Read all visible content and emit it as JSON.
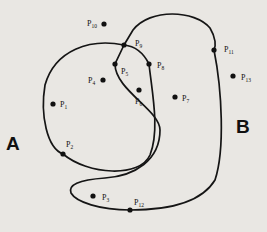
{
  "diagram": {
    "regions": [
      {
        "id": "A",
        "label": "A",
        "x": 6,
        "y": 150
      },
      {
        "id": "B",
        "label": "B",
        "x": 236,
        "y": 133
      }
    ],
    "points": [
      {
        "id": "P1",
        "base": "P",
        "sub": "1",
        "x": 53,
        "y": 104,
        "lx": 60,
        "ly": 107,
        "on_curve": false
      },
      {
        "id": "P2",
        "base": "P",
        "sub": "2",
        "x": 63,
        "y": 154,
        "lx": 66,
        "ly": 147,
        "on_curve": true
      },
      {
        "id": "P3",
        "base": "P",
        "sub": "3",
        "x": 93,
        "y": 196,
        "lx": 102,
        "ly": 200,
        "on_curve": false
      },
      {
        "id": "P4",
        "base": "P",
        "sub": "4",
        "x": 103,
        "y": 80,
        "lx": 88,
        "ly": 83,
        "on_curve": false
      },
      {
        "id": "P5",
        "base": "P",
        "sub": "5",
        "x": 115,
        "y": 64,
        "lx": 121,
        "ly": 74,
        "on_curve": true
      },
      {
        "id": "P6",
        "base": "P",
        "sub": "6",
        "x": 139,
        "y": 90,
        "lx": 135,
        "ly": 104,
        "on_curve": false
      },
      {
        "id": "P7",
        "base": "P",
        "sub": "7",
        "x": 175,
        "y": 97,
        "lx": 182,
        "ly": 101,
        "on_curve": false
      },
      {
        "id": "P8",
        "base": "P",
        "sub": "8",
        "x": 149,
        "y": 64,
        "lx": 157,
        "ly": 68,
        "on_curve": true
      },
      {
        "id": "P9",
        "base": "P",
        "sub": "9",
        "x": 124,
        "y": 45,
        "lx": 135,
        "ly": 46,
        "on_curve": true
      },
      {
        "id": "P10",
        "base": "P",
        "sub": "10",
        "x": 104,
        "y": 24,
        "lx": 87,
        "ly": 26,
        "on_curve": false
      },
      {
        "id": "P11",
        "base": "P",
        "sub": "11",
        "x": 214,
        "y": 50,
        "lx": 224,
        "ly": 52,
        "on_curve": true
      },
      {
        "id": "P12",
        "base": "P",
        "sub": "12",
        "x": 130,
        "y": 210,
        "lx": 134,
        "ly": 205,
        "on_curve": true
      },
      {
        "id": "P13",
        "base": "P",
        "sub": "13",
        "x": 233,
        "y": 76,
        "lx": 241,
        "ly": 80,
        "on_curve": false
      }
    ]
  }
}
